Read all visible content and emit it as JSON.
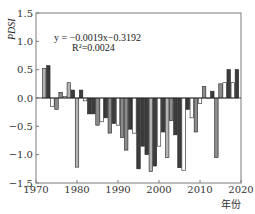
{
  "chart_data": {
    "type": "bar",
    "title": "",
    "xlabel": "年份",
    "ylabel": "PDSI",
    "xlim": [
      1970,
      2020
    ],
    "ylim": [
      -1.5,
      1.5
    ],
    "xticks": [
      1970,
      1980,
      1990,
      2000,
      2010,
      2020
    ],
    "yticks": [
      1.5,
      1.0,
      0.5,
      0.0,
      -0.5,
      -1.0,
      -1.5
    ],
    "ytick_labels": [
      "1.5",
      "1.0",
      "0.5",
      "0.0",
      "−0.5",
      "−1.0",
      "−1.5"
    ],
    "grid": false,
    "annotations": [
      {
        "text": "y = −0.0019x−0.3192",
        "x": 1977,
        "y": 1.0
      },
      {
        "text": "R²=0.0024",
        "x": 1979,
        "y": 0.8
      }
    ],
    "x": [
      1972,
      1973,
      1974,
      1975,
      1976,
      1977,
      1978,
      1979,
      1980,
      1981,
      1982,
      1983,
      1984,
      1985,
      1986,
      1987,
      1988,
      1989,
      1990,
      1991,
      1992,
      1993,
      1994,
      1995,
      1996,
      1997,
      1998,
      1999,
      2000,
      2001,
      2002,
      2003,
      2004,
      2005,
      2006,
      2007,
      2008,
      2009,
      2010,
      2011,
      2012,
      2013,
      2014,
      2015,
      2016,
      2017,
      2018,
      2019
    ],
    "values": [
      0.52,
      0.57,
      -0.15,
      -0.2,
      0.1,
      0.03,
      0.27,
      0.14,
      -1.22,
      0.14,
      -0.05,
      -0.28,
      -0.28,
      -0.48,
      -0.42,
      -0.35,
      -0.62,
      -0.45,
      -0.48,
      -0.7,
      -0.92,
      -0.55,
      -0.62,
      -1.25,
      -0.85,
      -1.0,
      -1.3,
      -1.2,
      -0.85,
      -0.6,
      -1.05,
      -0.4,
      -0.65,
      -1.23,
      -1.28,
      -0.2,
      -0.35,
      -0.6,
      -0.1,
      0.2,
      0.0,
      0.12,
      -1.05,
      0.25,
      0.27,
      0.5,
      0.27,
      0.5
    ],
    "bar_colors": [
      "#b4b4b4",
      "#3c3c3c",
      "#ffffff",
      "#8c8c8c",
      "#8c8c8c",
      "#ffffff",
      "#b4b4b4",
      "#3c3c3c",
      "#b4b4b4",
      "#3c3c3c",
      "#ffffff",
      "#3c3c3c",
      "#3c3c3c",
      "#8c8c8c",
      "#ffffff",
      "#3c3c3c",
      "#8c8c8c",
      "#3c3c3c",
      "#ffffff",
      "#8c8c8c",
      "#8c8c8c",
      "#3c3c3c",
      "#ffffff",
      "#3c3c3c",
      "#3c3c3c",
      "#3c3c3c",
      "#b4b4b4",
      "#3c3c3c",
      "#ffffff",
      "#3c3c3c",
      "#b4b4b4",
      "#8c8c8c",
      "#3c3c3c",
      "#3c3c3c",
      "#ffffff",
      "#3c3c3c",
      "#ffffff",
      "#8c8c8c",
      "#ffffff",
      "#8c8c8c",
      "#ffffff",
      "#3c3c3c",
      "#8c8c8c",
      "#8c8c8c",
      "#ffffff",
      "#3c3c3c",
      "#ffffff",
      "#3c3c3c"
    ],
    "trend_line": {
      "slope": -0.0019,
      "intercept": -0.3192,
      "r2": 0.0024
    }
  },
  "colors": {
    "axis": "#7a7a7a",
    "bar_stroke": "#222222"
  }
}
